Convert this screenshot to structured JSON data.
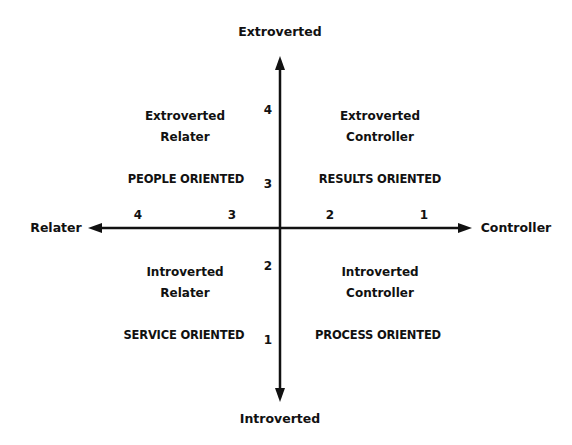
{
  "axes": {
    "top": "Extroverted",
    "bottom": "Introverted",
    "left": "Relater",
    "right": "Controller"
  },
  "quadrants": {
    "top_left": {
      "title_line1": "Extroverted",
      "title_line2": "Relater",
      "orientation": "PEOPLE ORIENTED"
    },
    "top_right": {
      "title_line1": "Extroverted",
      "title_line2": "Controller",
      "orientation": "RESULTS ORIENTED"
    },
    "bottom_left": {
      "title_line1": "Introverted",
      "title_line2": "Relater",
      "orientation": "SERVICE ORIENTED"
    },
    "bottom_right": {
      "title_line1": "Introverted",
      "title_line2": "Controller",
      "orientation": "PROCESS ORIENTED"
    }
  },
  "ticks": {
    "vertical": [
      "4",
      "3",
      "2",
      "1"
    ],
    "horizontal": [
      "4",
      "3",
      "2",
      "1"
    ]
  },
  "colors": {
    "line": "#111111",
    "background": "#ffffff"
  }
}
